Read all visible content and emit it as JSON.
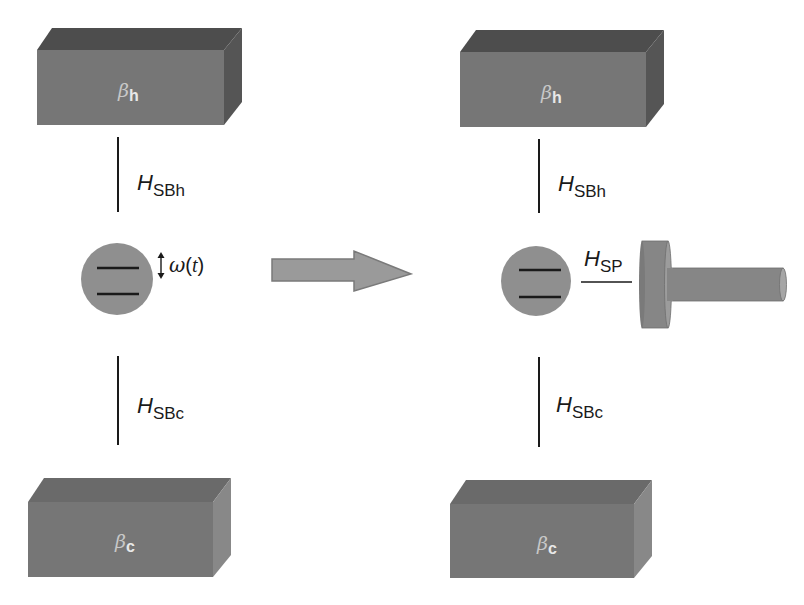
{
  "diagram": {
    "colors": {
      "bath_front": "#767676",
      "bath_top_hot": "#4d4d4d",
      "bath_side_hot": "#555555",
      "bath_top_cold": "#6a6a6a",
      "bath_side_cold": "#888888",
      "system_circle": "#8f8f8f",
      "arrow_fill": "#9a9a9a",
      "arrow_stroke": "#7a7a7a",
      "piston": "#868686",
      "line": "#1a1a1a"
    },
    "left_panel": {
      "hot_bath": {
        "symbol": "β",
        "subscript": "h"
      },
      "cold_bath": {
        "symbol": "β",
        "subscript": "c"
      },
      "coupling_hot": {
        "symbol": "H",
        "subscript": "SBh"
      },
      "coupling_cold": {
        "symbol": "H",
        "subscript": "SBc"
      },
      "system": {
        "levels": 2,
        "modulation_symbol": "↕",
        "modulation_label": "ω",
        "modulation_arg": "(",
        "modulation_t": "t",
        "modulation_close": ")"
      }
    },
    "transition_arrow": {
      "direction": "right"
    },
    "right_panel": {
      "hot_bath": {
        "symbol": "β",
        "subscript": "h"
      },
      "cold_bath": {
        "symbol": "β",
        "subscript": "c"
      },
      "coupling_hot": {
        "symbol": "H",
        "subscript": "SBh"
      },
      "coupling_cold": {
        "symbol": "H",
        "subscript": "SBc"
      },
      "coupling_piston": {
        "symbol": "H",
        "subscript": "SP"
      },
      "system": {
        "levels": 2
      },
      "piston": {
        "shape": "piston"
      }
    }
  }
}
